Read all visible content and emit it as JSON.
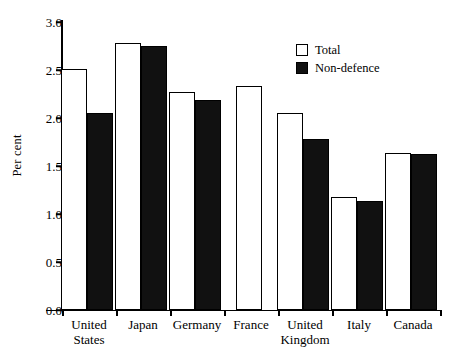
{
  "chart_data": {
    "type": "bar",
    "title": "",
    "subtitle": "",
    "xlabel": "",
    "ylabel": "Per cent",
    "ylim": [
      0.0,
      3.0
    ],
    "yticks": [
      "0.0",
      "0.5",
      "1.0",
      "1.5",
      "2.0",
      "2.5",
      "3.0"
    ],
    "ytick_values": [
      0.0,
      0.5,
      1.0,
      1.5,
      2.0,
      2.5,
      3.0
    ],
    "grid": false,
    "legend_position": "top-right",
    "categories": [
      "United\nStates",
      "Japan",
      "Germany",
      "France",
      "United\nKingdom",
      "Italy",
      "Canada"
    ],
    "series": [
      {
        "name": "Total",
        "color": "#ffffff",
        "edge_color": "#000000",
        "values": [
          2.51,
          2.78,
          2.27,
          2.33,
          2.05,
          1.18,
          1.64
        ]
      },
      {
        "name": "Non-defence",
        "color": "#111111",
        "edge_color": "#000000",
        "values": [
          2.05,
          2.75,
          2.19,
          null,
          1.78,
          1.14,
          1.62
        ]
      }
    ]
  },
  "legend": {
    "items": [
      {
        "label": "Total",
        "swatch": "hollow-square-icon"
      },
      {
        "label": "Non-defence",
        "swatch": "filled-square-icon"
      }
    ]
  },
  "axes": {
    "y_title": "Per cent"
  }
}
